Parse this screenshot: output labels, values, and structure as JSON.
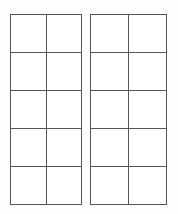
{
  "page": {
    "background_color": "#fdfdfd",
    "width": 178,
    "height": 214
  },
  "style": {
    "line_color": "#555555",
    "line_width_px": 1.5,
    "cell_fill": "#ffffff"
  },
  "grids": [
    {
      "id": "grid-left",
      "name": "left-grid",
      "columns": 2,
      "rows": 5,
      "x": 10,
      "y": 14,
      "width": 72,
      "height": 191,
      "cells": [
        [
          "",
          ""
        ],
        [
          "",
          ""
        ],
        [
          "",
          ""
        ],
        [
          "",
          ""
        ],
        [
          "",
          ""
        ]
      ]
    },
    {
      "id": "grid-right",
      "name": "right-grid",
      "columns": 2,
      "rows": 5,
      "x": 90,
      "y": 14,
      "width": 77,
      "height": 191,
      "cells": [
        [
          "",
          ""
        ],
        [
          "",
          ""
        ],
        [
          "",
          ""
        ],
        [
          "",
          ""
        ],
        [
          "",
          ""
        ]
      ]
    }
  ]
}
